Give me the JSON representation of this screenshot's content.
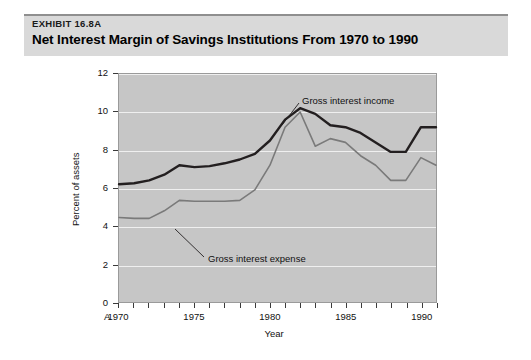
{
  "header": {
    "exhibit_number": "EXHIBIT 16.8A",
    "title": "Net Interest Margin of Savings Institutions From 1970 to 1990"
  },
  "figure": {
    "panel_letter": "A"
  },
  "chart_data": {
    "type": "line",
    "title": "Net Interest Margin of Savings Institutions From 1970 to 1990",
    "xlabel": "Year",
    "ylabel": "Percent of assets",
    "xlim": [
      1970,
      1991
    ],
    "ylim": [
      0,
      12
    ],
    "ytick_labels": [
      "0",
      "2",
      "4",
      "6",
      "8",
      "10",
      "12"
    ],
    "ytick_values": [
      0,
      2,
      4,
      6,
      8,
      10,
      12
    ],
    "xtick_labels": [
      "1970",
      "1975",
      "1980",
      "1985",
      "1990"
    ],
    "xtick_values": [
      1970,
      1975,
      1980,
      1985,
      1990
    ],
    "grid": true,
    "legend_position": "inline-annotations",
    "x": [
      1970,
      1971,
      1972,
      1973,
      1974,
      1975,
      1976,
      1977,
      1978,
      1979,
      1980,
      1981,
      1982,
      1983,
      1984,
      1985,
      1986,
      1987,
      1988,
      1989,
      1990,
      1991
    ],
    "series": [
      {
        "name": "Gross interest income",
        "color": "#231f20",
        "values": [
          6.2,
          6.25,
          6.4,
          6.7,
          7.2,
          7.1,
          7.15,
          7.3,
          7.5,
          7.8,
          8.5,
          9.6,
          10.2,
          9.9,
          9.3,
          9.2,
          8.9,
          8.4,
          7.9,
          7.9,
          9.2,
          9.2
        ]
      },
      {
        "name": "Gross interest expense",
        "color": "#7a7a7a",
        "values": [
          4.45,
          4.4,
          4.4,
          4.8,
          5.35,
          5.3,
          5.3,
          5.3,
          5.35,
          5.9,
          7.2,
          9.2,
          10.0,
          8.2,
          8.6,
          8.4,
          7.7,
          7.2,
          6.4,
          6.4,
          7.6,
          7.2
        ]
      }
    ],
    "annotations": [
      {
        "text": "Gross interest income",
        "series": "Gross interest income"
      },
      {
        "text": "Gross interest expense",
        "series": "Gross interest expense"
      }
    ]
  }
}
